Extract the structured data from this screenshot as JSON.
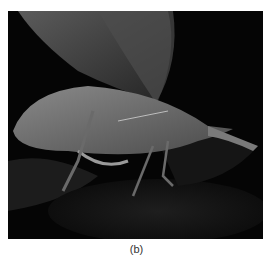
{
  "figure": {
    "caption": "(b)",
    "image_description": "Grayscale photograph of a leaf-mimicking katydid perched on dark leaves against a black background",
    "colors": {
      "background": "#ffffff",
      "photo_background": "#050505",
      "caption_text": "#333333"
    }
  }
}
